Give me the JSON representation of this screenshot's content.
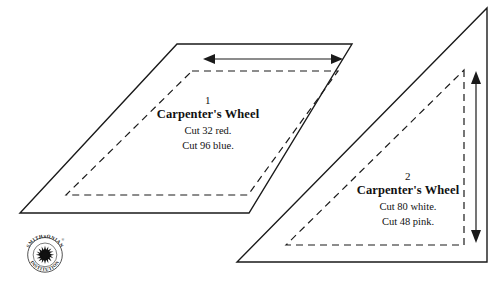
{
  "sheet": {
    "title": "Carpenter's Wheel quilt pattern template sheet",
    "background_color": "#ffffff",
    "line_color": "#1a1a1a"
  },
  "pieces": [
    {
      "shape": "parallelogram",
      "number": "1",
      "title": "Carpenter's Wheel",
      "cut_lines": [
        "Cut 32 red.",
        "Cut 96 blue."
      ],
      "grainline": "horizontal-double-arrow"
    },
    {
      "shape": "right-triangle",
      "number": "2",
      "title": "Carpenter's Wheel",
      "cut_lines": [
        "Cut 80 white.",
        "Cut 48 pink."
      ],
      "grainline": "vertical-double-arrow"
    }
  ],
  "seal": {
    "top_text": "SMITHSONIAN",
    "bottom_text": "INSTITUTION",
    "registered_mark": "®"
  }
}
